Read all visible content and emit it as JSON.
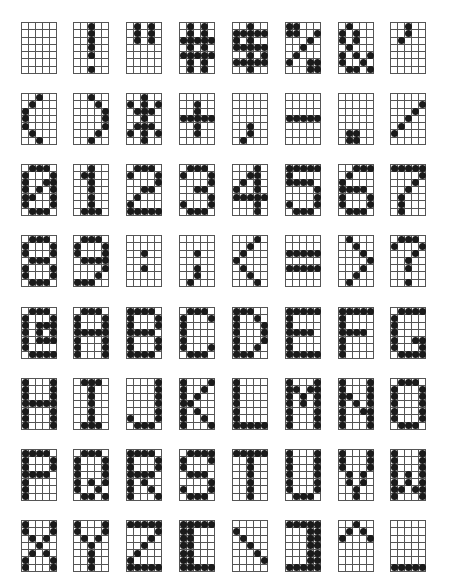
{
  "grid": {
    "cols": 5,
    "rows": 7
  },
  "layout": {
    "col_x": [
      21,
      73,
      126,
      179,
      232,
      285,
      338,
      390
    ],
    "row_y": [
      22,
      93,
      164,
      235,
      307,
      378,
      449,
      520
    ]
  },
  "rows": [
    [
      {
        "char": " ",
        "bitmap": [
          "00000",
          "00000",
          "00000",
          "00000",
          "00000",
          "00000",
          "00000"
        ]
      },
      {
        "char": "!",
        "bitmap": [
          "00100",
          "00100",
          "00100",
          "00100",
          "00100",
          "00000",
          "00100"
        ]
      },
      {
        "char": "\"",
        "bitmap": [
          "01010",
          "01010",
          "01010",
          "00000",
          "00000",
          "00000",
          "00000"
        ]
      },
      {
        "char": "#",
        "bitmap": [
          "01010",
          "01010",
          "11111",
          "01010",
          "11111",
          "01010",
          "01010"
        ]
      },
      {
        "char": "$",
        "bitmap": [
          "00100",
          "11111",
          "10100",
          "11111",
          "00101",
          "11111",
          "00100"
        ]
      },
      {
        "char": "%",
        "bitmap": [
          "11000",
          "11001",
          "00010",
          "00100",
          "01000",
          "10011",
          "00011"
        ]
      },
      {
        "char": "&",
        "bitmap": [
          "01000",
          "10100",
          "10100",
          "01000",
          "10101",
          "10010",
          "01101"
        ]
      },
      {
        "char": "'",
        "bitmap": [
          "00100",
          "00100",
          "01000",
          "00000",
          "00000",
          "00000",
          "00000"
        ]
      }
    ],
    [
      {
        "char": "(",
        "bitmap": [
          "00100",
          "01000",
          "10000",
          "10000",
          "10000",
          "01000",
          "00100"
        ]
      },
      {
        "char": ")",
        "bitmap": [
          "00100",
          "00010",
          "00001",
          "00001",
          "00001",
          "00010",
          "00100"
        ]
      },
      {
        "char": "*",
        "bitmap": [
          "00100",
          "10101",
          "01110",
          "00100",
          "01110",
          "10101",
          "00100"
        ]
      },
      {
        "char": "+",
        "bitmap": [
          "00000",
          "00100",
          "00100",
          "11111",
          "00100",
          "00100",
          "00000"
        ]
      },
      {
        "char": ",",
        "bitmap": [
          "00000",
          "00000",
          "00000",
          "00000",
          "00100",
          "00100",
          "01000"
        ]
      },
      {
        "char": "-",
        "bitmap": [
          "00000",
          "00000",
          "00000",
          "11111",
          "00000",
          "00000",
          "00000"
        ]
      },
      {
        "char": ".",
        "bitmap": [
          "00000",
          "00000",
          "00000",
          "00000",
          "00000",
          "01100",
          "01100"
        ]
      },
      {
        "char": "/",
        "bitmap": [
          "00000",
          "00001",
          "00010",
          "00100",
          "01000",
          "10000",
          "00000"
        ]
      }
    ],
    [
      {
        "char": "0",
        "bitmap": [
          "01110",
          "10001",
          "10011",
          "10101",
          "11001",
          "10001",
          "01110"
        ]
      },
      {
        "char": "1",
        "bitmap": [
          "00100",
          "01100",
          "00100",
          "00100",
          "00100",
          "00100",
          "01110"
        ]
      },
      {
        "char": "2",
        "bitmap": [
          "01110",
          "10001",
          "00001",
          "00110",
          "01000",
          "10000",
          "11111"
        ]
      },
      {
        "char": "3",
        "bitmap": [
          "01110",
          "10001",
          "00001",
          "00110",
          "00001",
          "10001",
          "01110"
        ]
      },
      {
        "char": "4",
        "bitmap": [
          "00010",
          "00110",
          "01010",
          "10010",
          "11111",
          "00010",
          "00010"
        ]
      },
      {
        "char": "5",
        "bitmap": [
          "11111",
          "10000",
          "11110",
          "00001",
          "00001",
          "10001",
          "01110"
        ]
      },
      {
        "char": "6",
        "bitmap": [
          "00111",
          "01000",
          "10000",
          "11110",
          "10001",
          "10001",
          "01110"
        ]
      },
      {
        "char": "7",
        "bitmap": [
          "11111",
          "00001",
          "00010",
          "00100",
          "01000",
          "01000",
          "01000"
        ]
      }
    ],
    [
      {
        "char": "8",
        "bitmap": [
          "01110",
          "10001",
          "10001",
          "01110",
          "10001",
          "10001",
          "01110"
        ]
      },
      {
        "char": "9",
        "bitmap": [
          "01110",
          "10001",
          "10001",
          "01111",
          "00001",
          "00010",
          "11100"
        ]
      },
      {
        "char": ":",
        "bitmap": [
          "00000",
          "00000",
          "00100",
          "00000",
          "00100",
          "00000",
          "00000"
        ]
      },
      {
        "char": ";",
        "bitmap": [
          "00000",
          "00000",
          "00100",
          "00000",
          "00100",
          "00100",
          "01000"
        ]
      },
      {
        "char": "<",
        "bitmap": [
          "00010",
          "00100",
          "01000",
          "10000",
          "01000",
          "00100",
          "00010"
        ]
      },
      {
        "char": "=",
        "bitmap": [
          "00000",
          "00000",
          "11111",
          "00000",
          "11111",
          "00000",
          "00000"
        ]
      },
      {
        "char": ">",
        "bitmap": [
          "01000",
          "00100",
          "00010",
          "00001",
          "00010",
          "00100",
          "01000"
        ]
      },
      {
        "char": "?",
        "bitmap": [
          "01110",
          "10001",
          "00010",
          "00100",
          "00100",
          "00000",
          "00100"
        ]
      }
    ],
    [
      {
        "char": "@",
        "bitmap": [
          "01110",
          "10001",
          "10111",
          "10101",
          "10111",
          "10000",
          "01111"
        ]
      },
      {
        "char": "A",
        "bitmap": [
          "01110",
          "10001",
          "10001",
          "11111",
          "10001",
          "10001",
          "10001"
        ]
      },
      {
        "char": "B",
        "bitmap": [
          "11110",
          "10001",
          "10001",
          "11110",
          "10001",
          "10001",
          "11110"
        ]
      },
      {
        "char": "C",
        "bitmap": [
          "01110",
          "10001",
          "10000",
          "10000",
          "10000",
          "10001",
          "01110"
        ]
      },
      {
        "char": "D",
        "bitmap": [
          "11100",
          "10010",
          "10001",
          "10001",
          "10001",
          "10010",
          "11100"
        ]
      },
      {
        "char": "E",
        "bitmap": [
          "11111",
          "10000",
          "10000",
          "11110",
          "10000",
          "10000",
          "11111"
        ]
      },
      {
        "char": "F",
        "bitmap": [
          "11111",
          "10000",
          "10000",
          "11110",
          "10000",
          "10000",
          "10000"
        ]
      },
      {
        "char": "G",
        "bitmap": [
          "01111",
          "10000",
          "10000",
          "10000",
          "10011",
          "10001",
          "01111"
        ]
      }
    ],
    [
      {
        "char": "H",
        "bitmap": [
          "10001",
          "10001",
          "10001",
          "11111",
          "10001",
          "10001",
          "10001"
        ]
      },
      {
        "char": "I",
        "bitmap": [
          "01110",
          "00100",
          "00100",
          "00100",
          "00100",
          "00100",
          "01110"
        ]
      },
      {
        "char": "J",
        "bitmap": [
          "00001",
          "00001",
          "00001",
          "00001",
          "00001",
          "10001",
          "01110"
        ]
      },
      {
        "char": "K",
        "bitmap": [
          "10001",
          "10010",
          "10100",
          "11000",
          "10100",
          "10010",
          "10001"
        ]
      },
      {
        "char": "L",
        "bitmap": [
          "10000",
          "10000",
          "10000",
          "10000",
          "10000",
          "10000",
          "11111"
        ]
      },
      {
        "char": "M",
        "bitmap": [
          "10001",
          "11011",
          "10101",
          "10101",
          "10001",
          "10001",
          "10001"
        ]
      },
      {
        "char": "N",
        "bitmap": [
          "10001",
          "10001",
          "11001",
          "10101",
          "10011",
          "10001",
          "10001"
        ]
      },
      {
        "char": "O",
        "bitmap": [
          "01110",
          "10001",
          "10001",
          "10001",
          "10001",
          "10001",
          "01110"
        ]
      }
    ],
    [
      {
        "char": "P",
        "bitmap": [
          "11110",
          "10001",
          "10001",
          "11110",
          "10000",
          "10000",
          "10000"
        ]
      },
      {
        "char": "Q",
        "bitmap": [
          "01110",
          "10001",
          "10001",
          "10001",
          "10101",
          "10010",
          "01101"
        ]
      },
      {
        "char": "R",
        "bitmap": [
          "11110",
          "10001",
          "10001",
          "11110",
          "10100",
          "10010",
          "10001"
        ]
      },
      {
        "char": "S",
        "bitmap": [
          "01111",
          "10001",
          "10000",
          "01110",
          "00001",
          "10001",
          "01110"
        ]
      },
      {
        "char": "T",
        "bitmap": [
          "11111",
          "00100",
          "00100",
          "00100",
          "00100",
          "00100",
          "00100"
        ]
      },
      {
        "char": "U",
        "bitmap": [
          "10001",
          "10001",
          "10001",
          "10001",
          "10001",
          "10001",
          "01110"
        ]
      },
      {
        "char": "V",
        "bitmap": [
          "10001",
          "10001",
          "10001",
          "01010",
          "01010",
          "00100",
          "00100"
        ]
      },
      {
        "char": "W",
        "bitmap": [
          "10001",
          "10001",
          "10001",
          "10101",
          "10101",
          "11011",
          "10001"
        ]
      }
    ],
    [
      {
        "char": "X",
        "bitmap": [
          "10001",
          "10001",
          "01010",
          "00100",
          "01010",
          "10001",
          "10001"
        ]
      },
      {
        "char": "Y",
        "bitmap": [
          "10001",
          "10001",
          "01010",
          "00100",
          "00100",
          "00100",
          "00100"
        ]
      },
      {
        "char": "Z",
        "bitmap": [
          "11111",
          "00001",
          "00010",
          "00100",
          "01000",
          "10000",
          "11111"
        ]
      },
      {
        "char": "[",
        "bitmap": [
          "11111",
          "11000",
          "11000",
          "11000",
          "11000",
          "11000",
          "11111"
        ]
      },
      {
        "char": "\\",
        "bitmap": [
          "00000",
          "10000",
          "01000",
          "00100",
          "00010",
          "00001",
          "00000"
        ]
      },
      {
        "char": "]",
        "bitmap": [
          "11111",
          "00011",
          "00011",
          "00011",
          "00011",
          "00011",
          "11111"
        ]
      },
      {
        "char": "^",
        "bitmap": [
          "00100",
          "01010",
          "10001",
          "00000",
          "00000",
          "00000",
          "00000"
        ]
      },
      {
        "char": "_",
        "bitmap": [
          "00000",
          "00000",
          "00000",
          "00000",
          "00000",
          "00000",
          "11111"
        ]
      }
    ]
  ],
  "chart_data": {
    "type": "table",
    "title": "",
    "characters": [
      " ",
      "!",
      "\"",
      "#",
      "$",
      "%",
      "&",
      "'",
      "(",
      ")",
      "*",
      "+",
      ",",
      "-",
      ".",
      "/",
      "0",
      "1",
      "2",
      "3",
      "4",
      "5",
      "6",
      "7",
      "8",
      "9",
      ":",
      ";",
      "<",
      "=",
      ">",
      "?",
      "@",
      "A",
      "B",
      "C",
      "D",
      "E",
      "F",
      "G",
      "H",
      "I",
      "J",
      "K",
      "L",
      "M",
      "N",
      "O",
      "P",
      "Q",
      "R",
      "S",
      "T",
      "U",
      "V",
      "W",
      "X",
      "Y",
      "Z",
      "[",
      "\\",
      "]",
      "^",
      "_"
    ]
  }
}
